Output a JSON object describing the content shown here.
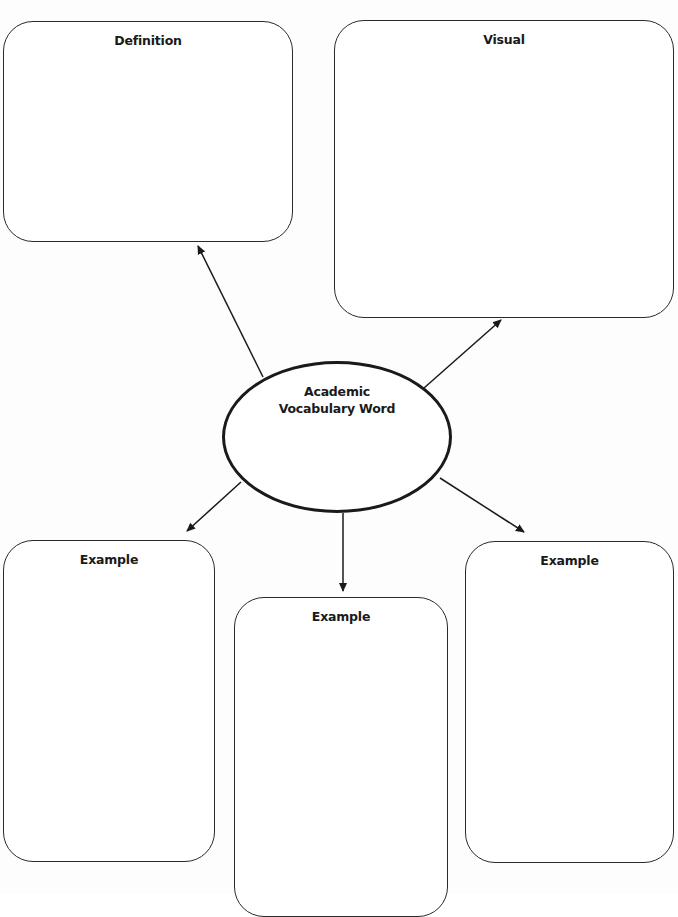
{
  "diagram": {
    "type": "graphic-organizer",
    "center": {
      "label_line1": "Academic",
      "label_line2": "Vocabulary Word"
    },
    "boxes": [
      {
        "id": "definition",
        "title": "Definition"
      },
      {
        "id": "visual",
        "title": "Visual"
      },
      {
        "id": "example-left",
        "title": "Example"
      },
      {
        "id": "example-center",
        "title": "Example"
      },
      {
        "id": "example-right",
        "title": "Example"
      }
    ],
    "connectors": [
      {
        "from": "center",
        "to": "definition"
      },
      {
        "from": "center",
        "to": "visual"
      },
      {
        "from": "center",
        "to": "example-left"
      },
      {
        "from": "center",
        "to": "example-center"
      },
      {
        "from": "center",
        "to": "example-right"
      }
    ]
  },
  "colors": {
    "stroke": "#2a2a2a",
    "background": "#ffffff"
  }
}
